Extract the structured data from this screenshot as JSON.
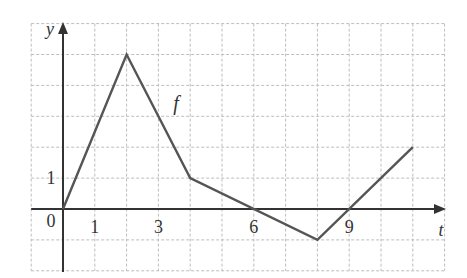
{
  "chart_data": {
    "type": "line",
    "title": "",
    "xlabel": "t",
    "ylabel": "y",
    "series": [
      {
        "name": "f",
        "x": [
          0,
          2,
          4,
          8,
          11
        ],
        "values": [
          0,
          5,
          1,
          -1,
          2
        ]
      }
    ],
    "xlim": [
      -1,
      12
    ],
    "ylim": [
      -2,
      6
    ],
    "x_tick_labels": [
      "1",
      "3",
      "6",
      "9"
    ],
    "x_tick_values": [
      1,
      3,
      6,
      9
    ],
    "y_tick_labels": [
      "1"
    ],
    "y_tick_values": [
      1
    ],
    "origin_label": "0",
    "grid": true,
    "grid_style": "dashed",
    "legend": null,
    "annotations": [
      {
        "text": "f",
        "x": 3.5,
        "y": 3.2
      }
    ]
  },
  "colors": {
    "curve": "#555555",
    "axis": "#333333",
    "grid": "#bdbdbd",
    "text": "#333333"
  }
}
